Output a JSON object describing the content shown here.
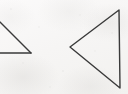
{
  "figure": {
    "title": "Two hand-drawn triangle outlines",
    "medium": "scanned line drawing",
    "canvas": {
      "width": 128,
      "height": 94
    },
    "background_color": "#f7f6f5",
    "stroke_color": "#3a3a3a",
    "stroke_width": 1.4,
    "shapes": [
      {
        "id": "left-triangle",
        "name": "cropped-triangle",
        "label": "Partially cropped triangle at left edge",
        "closed": false,
        "cropped": true,
        "crop_edge": "left",
        "visible_vertices": [
          {
            "x": 0,
            "y": 22
          },
          {
            "x": 31,
            "y": 53
          },
          {
            "x": 0,
            "y": 53
          }
        ],
        "edges": [
          {
            "name": "hypotenuse",
            "from": {
              "x": 0,
              "y": 22
            },
            "to": {
              "x": 31,
              "y": 53
            }
          },
          {
            "name": "baseline",
            "from": {
              "x": 0,
              "y": 53
            },
            "to": {
              "x": 31,
              "y": 53
            }
          }
        ]
      },
      {
        "id": "right-triangle",
        "name": "left-pointing-triangle",
        "label": "Complete left-pointing triangle",
        "closed": true,
        "cropped": false,
        "visible_vertices": [
          {
            "x": 70,
            "y": 47
          },
          {
            "x": 119,
            "y": 10
          },
          {
            "x": 120,
            "y": 88
          }
        ],
        "edges": [
          {
            "name": "upper-edge",
            "from": {
              "x": 70,
              "y": 47
            },
            "to": {
              "x": 119,
              "y": 10
            }
          },
          {
            "name": "right-edge",
            "from": {
              "x": 119,
              "y": 10
            },
            "to": {
              "x": 120,
              "y": 88
            }
          },
          {
            "name": "lower-edge",
            "from": {
              "x": 120,
              "y": 88
            },
            "to": {
              "x": 70,
              "y": 47
            }
          }
        ]
      }
    ]
  }
}
